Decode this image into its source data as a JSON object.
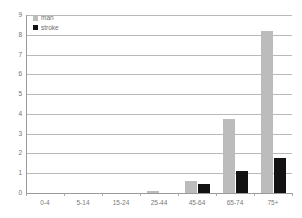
{
  "chart_data": {
    "type": "bar",
    "title": "",
    "subtitle": "",
    "xlabel": "",
    "ylabel": "",
    "categories": [
      "0-4",
      "5-14",
      "15-24",
      "25-44",
      "45-64",
      "65-74",
      "75+"
    ],
    "series": [
      {
        "name": "man",
        "color": "#bcbcbc",
        "values": [
          0,
          0,
          0,
          0.1,
          0.62,
          3.75,
          8.2
        ]
      },
      {
        "name": "stroke",
        "color": "#121212",
        "values": [
          0,
          0,
          0,
          0,
          0.45,
          1.1,
          1.78
        ]
      }
    ],
    "ylim": [
      0,
      9
    ],
    "yticks": [
      0,
      1,
      2,
      3,
      4,
      5,
      6,
      7,
      8,
      9
    ],
    "ytick_labels": [
      "0",
      "1",
      "2",
      "3",
      "4",
      "5",
      "6",
      "7",
      "8",
      "9"
    ],
    "grid": true,
    "grid_axis": "y",
    "legend_position": "top-left",
    "legend_entries": [
      "man",
      "stroke"
    ]
  },
  "colors": {
    "background": "#ffffff",
    "gridline": "#b8b8b8",
    "axis": "#9a9a9a",
    "tick_text": "#707070",
    "label_text": "#7a7a7a",
    "series_0": "#bcbcbc",
    "series_1": "#121212"
  }
}
